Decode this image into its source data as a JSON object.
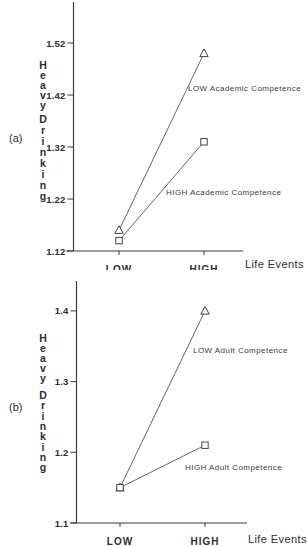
{
  "page": {
    "background": "#ffffff",
    "ink_color": "#3c3c3c",
    "line_color": "#555555",
    "marker_stroke": "#444444",
    "marker_fill": "#ffffff"
  },
  "chart_data": [
    {
      "type": "line",
      "panel_label": "(a)",
      "title": "",
      "xlabel": "Life Events",
      "ylabel": "Heavy Drinking",
      "categories": [
        "LOW",
        "HIGH"
      ],
      "y_ticks": [
        {
          "value": 1.12,
          "label": "1.12"
        },
        {
          "value": 1.22,
          "label": "1.22"
        },
        {
          "value": 1.32,
          "label": "1.32"
        },
        {
          "value": 1.42,
          "label": "1.42"
        },
        {
          "value": 1.52,
          "label": "1.52"
        }
      ],
      "ylim": [
        1.12,
        1.56
      ],
      "grid": false,
      "legend_position": "inline-annotations",
      "series": [
        {
          "name": "LOW Academic Competence",
          "marker": "triangle",
          "values": [
            1.16,
            1.5
          ]
        },
        {
          "name": "HIGH Academic Competence",
          "marker": "square",
          "values": [
            1.14,
            1.33
          ]
        }
      ]
    },
    {
      "type": "line",
      "panel_label": "(b)",
      "title": "",
      "xlabel": "Life Events",
      "ylabel": "Heavy Drinking",
      "categories": [
        "LOW",
        "HIGH"
      ],
      "y_ticks": [
        {
          "value": 1.1,
          "label": "1.1"
        },
        {
          "value": 1.2,
          "label": "1.2"
        },
        {
          "value": 1.3,
          "label": "1.3"
        },
        {
          "value": 1.4,
          "label": "1.4"
        }
      ],
      "ylim": [
        1.1,
        1.44
      ],
      "grid": false,
      "legend_position": "inline-annotations",
      "series": [
        {
          "name": "LOW Adult Competence",
          "marker": "triangle",
          "values": [
            1.15,
            1.4
          ]
        },
        {
          "name": "HIGH Adult Competence",
          "marker": "square",
          "values": [
            1.15,
            1.21
          ]
        }
      ]
    }
  ]
}
